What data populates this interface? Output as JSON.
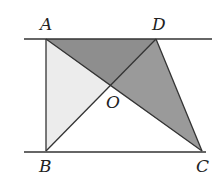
{
  "figure": {
    "type": "geometry",
    "points": {
      "A": {
        "label": "A",
        "x": 46,
        "y": 39
      },
      "D": {
        "label": "D",
        "x": 156,
        "y": 39
      },
      "B": {
        "label": "B",
        "x": 46,
        "y": 151
      },
      "C": {
        "label": "C",
        "x": 202,
        "y": 151
      },
      "O": {
        "label": "O",
        "x": 110,
        "y": 86
      }
    },
    "parallel_lines": [
      {
        "name": "top-line",
        "x1": 24,
        "x2": 212,
        "y": 39
      },
      {
        "name": "bottom-line",
        "x1": 24,
        "x2": 206,
        "y": 152
      }
    ],
    "shaded_regions": [
      {
        "name": "triangle-AOD",
        "vertices": [
          "A",
          "O",
          "D"
        ],
        "color": "#8e8e8e"
      },
      {
        "name": "triangle-DOC",
        "vertices": [
          "D",
          "O",
          "C"
        ],
        "color": "#9a9a9a"
      },
      {
        "name": "triangle-AOB",
        "vertices": [
          "A",
          "O",
          "B"
        ],
        "color": "#ececec"
      }
    ],
    "colors": {
      "stroke": "#333333"
    }
  }
}
